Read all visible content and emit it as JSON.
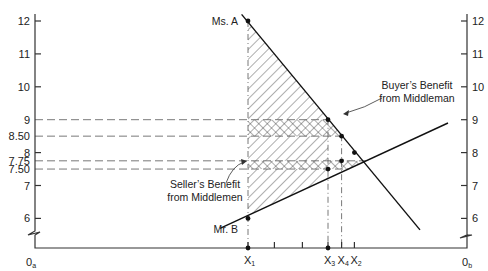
{
  "chart_data": {
    "type": "line",
    "title": "",
    "xlabel": "",
    "ylabel": "",
    "y_axis_left_origin_label": "0",
    "y_axis_left_origin_sub": "a",
    "y_axis_right_origin_label": "0",
    "y_axis_right_origin_sub": "b",
    "ylim": [
      5.3,
      12.3
    ],
    "y_ticks": [
      {
        "value": 12,
        "label": "12"
      },
      {
        "value": 11,
        "label": "11"
      },
      {
        "value": 10,
        "label": "10"
      },
      {
        "value": 9,
        "label": "9"
      },
      {
        "value": 8.5,
        "label": "8.50"
      },
      {
        "value": 8,
        "label": "8"
      },
      {
        "value": 7.75,
        "label": "7.75"
      },
      {
        "value": 7.5,
        "label": "7.50"
      },
      {
        "value": 7,
        "label": "7"
      },
      {
        "value": 6,
        "label": "6"
      }
    ],
    "y_ticks_right": [
      {
        "value": 12,
        "label": "12"
      },
      {
        "value": 11,
        "label": "11"
      },
      {
        "value": 10,
        "label": "10"
      },
      {
        "value": 9,
        "label": "9"
      },
      {
        "value": 8,
        "label": "8"
      },
      {
        "value": 7,
        "label": "7"
      },
      {
        "value": 6,
        "label": "6"
      }
    ],
    "x_ticks": [
      {
        "id": "X1",
        "label": "X",
        "sub": "1",
        "x": 1.0,
        "marker": true
      },
      {
        "id": "t2",
        "label": "",
        "sub": "",
        "x": 1.33,
        "marker": false
      },
      {
        "id": "t3",
        "label": "",
        "sub": "",
        "x": 1.68,
        "marker": false
      },
      {
        "id": "X3",
        "label": "X",
        "sub": "3",
        "x": 2.0,
        "marker": true
      },
      {
        "id": "X4",
        "label": "X",
        "sub": "4",
        "x": 2.17,
        "marker": false
      },
      {
        "id": "X2",
        "label": "X",
        "sub": "2",
        "x": 2.33,
        "marker": false
      }
    ],
    "xlim": [
      -1.65,
      3.75
    ],
    "series": [
      {
        "name": "Ms. A",
        "label": "Ms. A",
        "points": [
          [
            0.92,
            12.2
          ],
          [
            3.15,
            5.65
          ]
        ]
      },
      {
        "name": "Mr. B",
        "label": "Mr. B",
        "points": [
          [
            0.65,
            5.7
          ],
          [
            3.5,
            8.9
          ]
        ]
      }
    ],
    "marked_points": [
      {
        "x": 1.0,
        "y": 12
      },
      {
        "x": 1.0,
        "y": 6
      },
      {
        "x": 2.0,
        "y": 9
      },
      {
        "x": 2.0,
        "y": 7.5
      },
      {
        "x": 2.17,
        "y": 8.5
      },
      {
        "x": 2.17,
        "y": 7.75
      },
      {
        "x": 2.33,
        "y": 8
      },
      {
        "x": 1.0,
        "y": 5.3
      },
      {
        "x": 2.0,
        "y": 5.3
      }
    ],
    "reference_lines": {
      "horizontal_dashed": [
        9,
        8.5,
        7.75,
        7.5
      ],
      "vertical_dashdot": [
        1.0,
        2.0,
        2.17
      ]
    },
    "shaded_regions": [
      {
        "name": "hatched-area-between-curves",
        "pattern": "diagonal",
        "x_from": 1.0,
        "x_to": 2.0
      },
      {
        "name": "buyer-benefit-band",
        "pattern": "crosshatch",
        "y_from": 8.5,
        "y_to": 9
      },
      {
        "name": "seller-benefit-band",
        "pattern": "crosshatch",
        "y_from": 7.5,
        "y_to": 7.75
      }
    ],
    "annotations": [
      {
        "id": "buyer",
        "lines": [
          "Buyer’s Benefit",
          "from Middleman"
        ]
      },
      {
        "id": "seller",
        "lines": [
          "Seller’s Benefit",
          "from Middlemen"
        ]
      }
    ]
  }
}
